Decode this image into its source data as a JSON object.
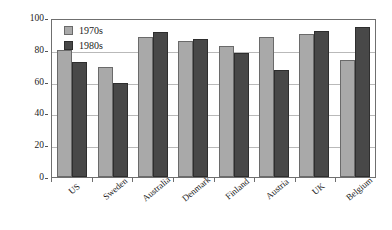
{
  "chart_data": {
    "type": "bar",
    "title": "",
    "subtitle": "",
    "xlabel": "",
    "ylabel": "Percentage",
    "ylim": [
      0,
      100
    ],
    "yticks": [
      0,
      20,
      40,
      60,
      80,
      100
    ],
    "ytick_labels": [
      "0",
      "20",
      "40",
      "60",
      "80",
      "100"
    ],
    "grid": "horizontal",
    "legend_position": "top-left-inside",
    "categories": [
      "US",
      "Sweden",
      "Australia",
      "Denmark",
      "Finland",
      "Austria",
      "UK",
      "Belgium"
    ],
    "series": [
      {
        "name": "1970s",
        "color": "#a9a9a9",
        "values": [
          80,
          69.5,
          88,
          85.5,
          82.5,
          88,
          90,
          73.5
        ]
      },
      {
        "name": "1980s",
        "color": "#484848",
        "values": [
          72.5,
          59,
          91,
          86.5,
          78,
          67.5,
          92,
          94.5
        ]
      }
    ]
  },
  "axis": {
    "y_title": "Percentage"
  },
  "legend": {
    "items": [
      {
        "label": "1970s",
        "swatch": "legend-swatch-1970s"
      },
      {
        "label": "1980s",
        "swatch": "legend-swatch-1980s"
      }
    ]
  },
  "colors": {
    "series_1970s": "#a9a9a9",
    "series_1980s": "#484848",
    "gridline": "#b9b9b9",
    "frame": "#6f6f6f",
    "text": "#1c1c1c",
    "background": "#ffffff"
  }
}
